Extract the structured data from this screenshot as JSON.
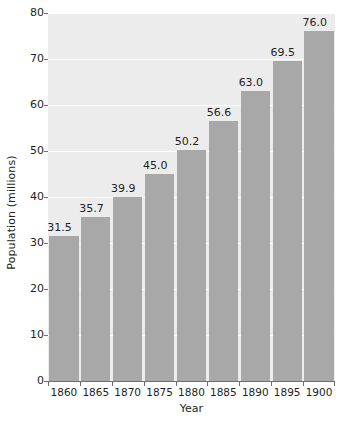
{
  "chart_data": {
    "type": "bar",
    "title": "",
    "xlabel": "Year",
    "ylabel": "Population (millions)",
    "categories": [
      "1860",
      "1865",
      "1870",
      "1875",
      "1880",
      "1885",
      "1890",
      "1895",
      "1900"
    ],
    "values": [
      31.5,
      35.7,
      39.9,
      45.0,
      50.2,
      56.6,
      63.0,
      69.5,
      76.0
    ],
    "value_labels": [
      "31.5",
      "35.7",
      "39.9",
      "45.0",
      "50.2",
      "56.6",
      "63.0",
      "69.5",
      "76.0"
    ],
    "ylim": [
      0,
      80
    ],
    "yticks": [
      0,
      10,
      20,
      30,
      40,
      50,
      60,
      70,
      80
    ],
    "ytick_labels": [
      "0",
      "10",
      "20",
      "30",
      "40",
      "50",
      "60",
      "70",
      "80"
    ],
    "grid": true,
    "gridline_color": "#ffffff",
    "legend": null,
    "bar_color": "#a8a8a8",
    "plot_background": "#ececec",
    "text_color": "#231f20",
    "axis_color": "#6d6e71"
  }
}
